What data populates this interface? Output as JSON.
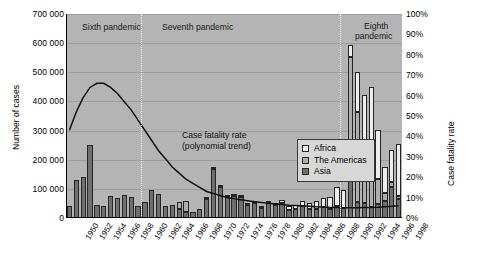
{
  "chart_data": {
    "type": "bar",
    "title": "",
    "xlabel": "",
    "ylabel": "Number of cases",
    "y2label": "Case fatality rate",
    "ylim": [
      0,
      700000
    ],
    "y2lim": [
      0,
      100
    ],
    "grid": true,
    "legend_position": "inside-center-right",
    "stacked": true,
    "categories": [
      1950,
      1951,
      1952,
      1953,
      1954,
      1955,
      1956,
      1957,
      1958,
      1959,
      1960,
      1961,
      1962,
      1963,
      1964,
      1965,
      1966,
      1967,
      1968,
      1969,
      1970,
      1971,
      1972,
      1973,
      1974,
      1975,
      1976,
      1977,
      1978,
      1979,
      1980,
      1981,
      1982,
      1983,
      1984,
      1985,
      1986,
      1987,
      1988,
      1989,
      1990,
      1991,
      1992,
      1993,
      1994,
      1995,
      1996,
      1997,
      1998
    ],
    "ytick_labels": [
      "0",
      "100 000",
      "200 000",
      "300 000",
      "400 000",
      "500 000",
      "600 000",
      "700 000"
    ],
    "ytick_values": [
      0,
      100000,
      200000,
      300000,
      400000,
      500000,
      600000,
      700000
    ],
    "y2tick_labels": [
      "0%",
      "10%",
      "20%",
      "30%",
      "40%",
      "50%",
      "60%",
      "70%",
      "80%",
      "90%",
      "100%"
    ],
    "y2tick_values": [
      0,
      10,
      20,
      30,
      40,
      50,
      60,
      70,
      80,
      90,
      100
    ],
    "xtick_labels": [
      "1950",
      "1952",
      "1954",
      "1956",
      "1958",
      "1960",
      "1962",
      "1964",
      "1966",
      "1968",
      "1970",
      "1972",
      "1974",
      "1976",
      "1978",
      "1980",
      "1982",
      "1984",
      "1986",
      "1988",
      "1990",
      "1992",
      "1994",
      "1996",
      "1998"
    ],
    "series": [
      {
        "name": "Africa",
        "color": "#ededed",
        "values": [
          0,
          0,
          0,
          0,
          0,
          0,
          0,
          0,
          0,
          0,
          0,
          0,
          0,
          0,
          0,
          0,
          0,
          0,
          0,
          0,
          2000,
          3000,
          3000,
          4000,
          4000,
          3000,
          3000,
          4000,
          6000,
          7000,
          8000,
          10000,
          12000,
          14000,
          16000,
          20000,
          25000,
          30000,
          42000,
          65000,
          60000,
          42000,
          135000,
          190000,
          290000,
          170000,
          90000,
          110000,
          180000
        ]
      },
      {
        "name": "The Americas",
        "color": "#adadad",
        "values": [
          0,
          0,
          0,
          0,
          0,
          0,
          0,
          0,
          0,
          0,
          0,
          0,
          0,
          0,
          0,
          0,
          25000,
          40000,
          0,
          0,
          0,
          0,
          0,
          0,
          0,
          0,
          0,
          0,
          0,
          0,
          0,
          0,
          0,
          0,
          0,
          0,
          0,
          0,
          0,
          0,
          0,
          400000,
          310000,
          180000,
          120000,
          85000,
          25000,
          18000,
          10000
        ]
      },
      {
        "name": "Asia",
        "color": "#6f6f6f",
        "values": [
          42000,
          130000,
          140000,
          250000,
          45000,
          40000,
          75000,
          70000,
          80000,
          72000,
          40000,
          55000,
          95000,
          82000,
          40000,
          45000,
          30000,
          20000,
          20000,
          32000,
          65000,
          168000,
          105000,
          72000,
          75000,
          72000,
          45000,
          50000,
          35000,
          52000,
          45000,
          52000,
          28000,
          30000,
          42000,
          30000,
          32000,
          38000,
          30000,
          40000,
          35000,
          152000,
          55000,
          52000,
          38000,
          48000,
          60000,
          105000,
          65000
        ]
      }
    ],
    "case_fatality_rate": {
      "name": "Case fatality rate (polynomial trend)",
      "values": [
        43,
        52,
        59,
        64,
        66,
        66,
        64,
        61,
        57,
        53,
        48,
        43,
        38,
        33,
        29,
        25,
        22,
        19,
        17,
        15,
        13,
        12,
        11,
        10,
        9.5,
        9,
        8.5,
        8,
        7.6,
        7.2,
        6.9,
        6.6,
        6.3,
        6.1,
        5.9,
        5.7,
        5.5,
        5.4,
        5.2,
        5.1,
        5,
        5,
        5,
        5.1,
        5.2,
        5.3,
        5.5,
        5.7,
        6
      ]
    },
    "annotations": [
      {
        "name": "case-fatality-annotation",
        "line1": "Case fatality rate",
        "line2": "(polynomial trend)"
      }
    ],
    "pandemic_periods": [
      {
        "name": "Sixth pandemic",
        "label": "Sixth pandemic",
        "start": 1950,
        "end": 1961
      },
      {
        "name": "Seventh pandemic",
        "label": "Seventh pandemic",
        "start": 1961,
        "end": 1990
      },
      {
        "name": "Eighth pandemic",
        "label": "Eighth",
        "label2": "pandemic",
        "start": 1990,
        "end": 1998
      }
    ],
    "legend_entries": [
      {
        "label": "Africa",
        "color": "#ededed"
      },
      {
        "label": "The Americas",
        "color": "#adadad"
      },
      {
        "label": "Asia",
        "color": "#6f6f6f"
      }
    ]
  }
}
